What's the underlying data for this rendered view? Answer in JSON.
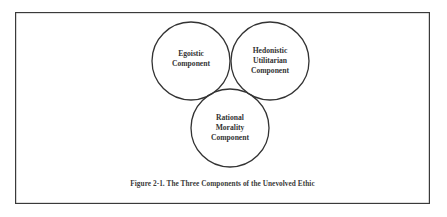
{
  "figure": {
    "caption": "Figure 2-1.  The Three Components of the Unevolved Ethic",
    "stroke_color": "#333333",
    "components": [
      {
        "id": "egoistic",
        "lines": [
          "Egoistic",
          "Component"
        ],
        "cx": 191,
        "cy": 61,
        "r": 39
      },
      {
        "id": "hedonistic-utilitarian",
        "lines": [
          "Hedonistic",
          "Utilitarian",
          "Component"
        ],
        "cx": 270,
        "cy": 61,
        "r": 39
      },
      {
        "id": "rational-morality",
        "lines": [
          "Rational",
          "Morality",
          "Component"
        ],
        "cx": 230,
        "cy": 128,
        "r": 39
      }
    ]
  }
}
